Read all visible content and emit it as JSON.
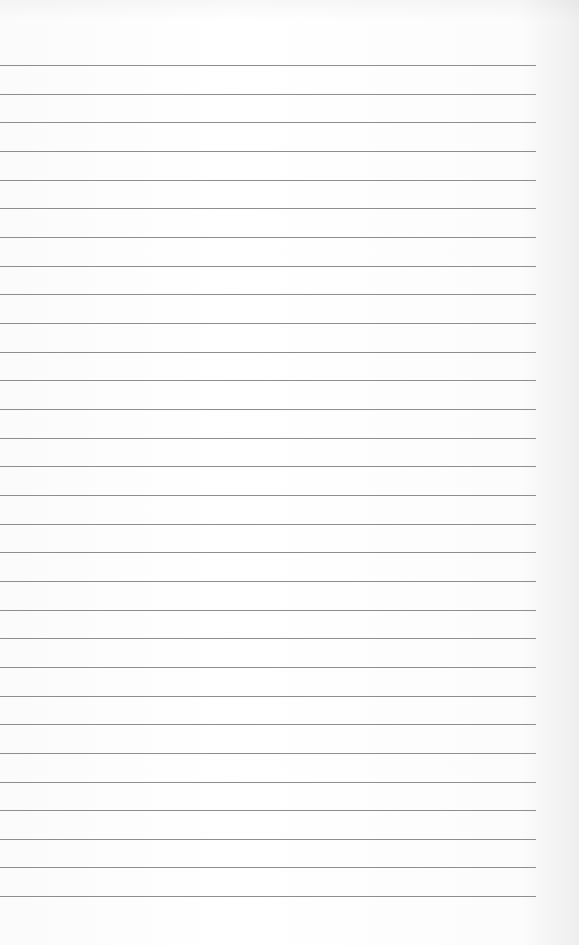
{
  "page": {
    "type": "lined-paper",
    "background_color": "#ffffff",
    "rule_color": "#8e8e8e",
    "rule_count": 30,
    "first_rule_y": 65,
    "rule_spacing": 28.66,
    "rule_left": 0,
    "rule_right": 536,
    "text": ""
  }
}
